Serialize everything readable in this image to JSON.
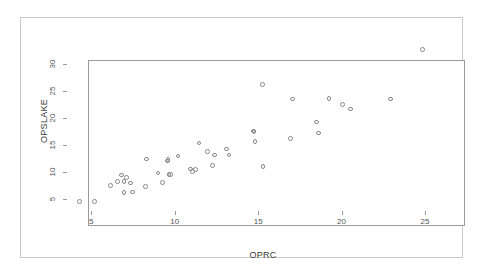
{
  "chart_data": {
    "type": "scatter",
    "title": "",
    "xlabel": "OPRC",
    "ylabel": "OPSLAKE",
    "xlim": [
      3.6,
      26.2
    ],
    "ylim": [
      3.2,
      33.8
    ],
    "xticks": [
      5,
      10,
      15,
      20,
      25
    ],
    "yticks": [
      5,
      10,
      15,
      20,
      25,
      30
    ],
    "xtick_labels": [
      "5",
      "10",
      "15",
      "20",
      "25"
    ],
    "ytick_labels": [
      "5",
      "10",
      "15",
      "20",
      "25",
      "30"
    ],
    "grid": false,
    "legend": "none",
    "marker": "open-circle",
    "marker_color": "#8a8a8a",
    "series": [
      {
        "name": "OPSLAKE vs OPRC",
        "points": [
          {
            "x": 4.3,
            "y": 4.6
          },
          {
            "x": 5.2,
            "y": 4.6
          },
          {
            "x": 6.15,
            "y": 7.55
          },
          {
            "x": 6.55,
            "y": 8.3
          },
          {
            "x": 6.8,
            "y": 9.5
          },
          {
            "x": 6.95,
            "y": 8.25
          },
          {
            "x": 6.95,
            "y": 6.2
          },
          {
            "x": 7.1,
            "y": 9.05
          },
          {
            "x": 7.35,
            "y": 8.0
          },
          {
            "x": 7.45,
            "y": 6.3
          },
          {
            "x": 8.25,
            "y": 7.3
          },
          {
            "x": 8.3,
            "y": 12.4
          },
          {
            "x": 9.0,
            "y": 9.85
          },
          {
            "x": 9.25,
            "y": 8.1
          },
          {
            "x": 9.55,
            "y": 12.05
          },
          {
            "x": 9.6,
            "y": 12.35
          },
          {
            "x": 9.65,
            "y": 9.6
          },
          {
            "x": 9.75,
            "y": 9.6
          },
          {
            "x": 10.2,
            "y": 12.95
          },
          {
            "x": 10.95,
            "y": 10.55
          },
          {
            "x": 11.05,
            "y": 10.15
          },
          {
            "x": 11.25,
            "y": 10.5
          },
          {
            "x": 11.45,
            "y": 15.4
          },
          {
            "x": 11.95,
            "y": 13.75
          },
          {
            "x": 12.25,
            "y": 11.2
          },
          {
            "x": 12.4,
            "y": 13.15
          },
          {
            "x": 13.1,
            "y": 14.25
          },
          {
            "x": 13.25,
            "y": 13.15
          },
          {
            "x": 14.7,
            "y": 17.55
          },
          {
            "x": 14.75,
            "y": 17.5
          },
          {
            "x": 14.8,
            "y": 15.65
          },
          {
            "x": 15.25,
            "y": 26.1
          },
          {
            "x": 15.3,
            "y": 11.0
          },
          {
            "x": 16.95,
            "y": 16.2
          },
          {
            "x": 17.05,
            "y": 23.45
          },
          {
            "x": 18.5,
            "y": 19.25
          },
          {
            "x": 18.6,
            "y": 17.2
          },
          {
            "x": 19.25,
            "y": 23.55
          },
          {
            "x": 20.05,
            "y": 22.45
          },
          {
            "x": 20.55,
            "y": 21.65
          },
          {
            "x": 22.95,
            "y": 23.45
          },
          {
            "x": 24.85,
            "y": 32.6
          }
        ]
      }
    ]
  }
}
